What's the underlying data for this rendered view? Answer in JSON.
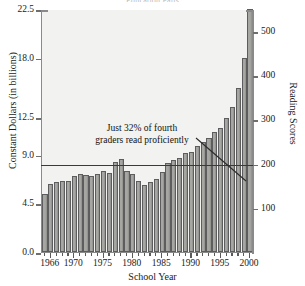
{
  "title_clipped": "Education Fails",
  "axis": {
    "x_label": "School Year",
    "y_left_label": "Constant Dollars (in billions)",
    "y_right_label": "Reading Scores",
    "y_left_ticks": [
      "0.0",
      "4.5",
      "9.0",
      "12.5",
      "18.0",
      "22.5"
    ],
    "y_right_ticks": [
      "100",
      "200",
      "300",
      "400",
      "500"
    ],
    "x_ticks": [
      "1966",
      "1970",
      "1975",
      "1980",
      "1985",
      "1990",
      "1995",
      "2000"
    ]
  },
  "annotation": {
    "line1": "Just 32% of fourth",
    "line2": "graders read proficiently"
  },
  "colors": {
    "bar_fill": "#a6a6a3",
    "bar_edge": "#5d5d5d",
    "plot_bg": "#f2f2f0",
    "axis": "#8a8a8a",
    "score_line": "#3a3a3a"
  },
  "chart_data": {
    "type": "bar",
    "title": "Education Fails",
    "xlabel": "School Year",
    "ylabel": "Constant Dollars (in billions)",
    "y2label": "Reading Scores",
    "ylim": [
      0,
      22.5
    ],
    "y2lim": [
      0,
      550
    ],
    "grid": false,
    "legend": null,
    "categories": [
      "1965",
      "1966",
      "1967",
      "1968",
      "1969",
      "1970",
      "1971",
      "1972",
      "1973",
      "1974",
      "1975",
      "1976",
      "1977",
      "1978",
      "1979",
      "1980",
      "1981",
      "1982",
      "1983",
      "1984",
      "1985",
      "1986",
      "1987",
      "1988",
      "1989",
      "1990",
      "1991",
      "1992",
      "1993",
      "1994",
      "1995",
      "1996",
      "1997",
      "1998",
      "1999",
      "2000"
    ],
    "series": [
      {
        "name": "Constant Dollars (in billions)",
        "type": "bar",
        "values": [
          5.4,
          6.3,
          6.5,
          6.6,
          6.6,
          7.0,
          7.2,
          7.1,
          7.0,
          7.2,
          7.5,
          7.3,
          8.3,
          8.6,
          7.5,
          7.2,
          6.6,
          6.2,
          6.5,
          6.8,
          7.4,
          8.2,
          8.5,
          8.7,
          9.2,
          9.3,
          9.8,
          10.2,
          10.6,
          11.1,
          11.5,
          12.4,
          13.4,
          15.2,
          18.0,
          22.5
        ]
      },
      {
        "name": "Reading Scores",
        "type": "line",
        "axis": "right",
        "values": [
          null,
          null,
          null,
          null,
          null,
          null,
          200,
          200,
          200,
          200,
          200,
          200,
          200,
          200,
          200,
          200,
          200,
          200,
          200,
          200,
          200,
          200,
          200,
          200,
          200,
          200,
          200,
          200,
          200,
          200,
          200,
          200,
          200,
          200,
          200,
          200
        ],
        "note": "Flat horizontal reference line at 200"
      }
    ],
    "annotations": [
      {
        "text": "Just 32% of fourth graders read proficiently",
        "points_to": "reading score line near 1999"
      }
    ]
  }
}
